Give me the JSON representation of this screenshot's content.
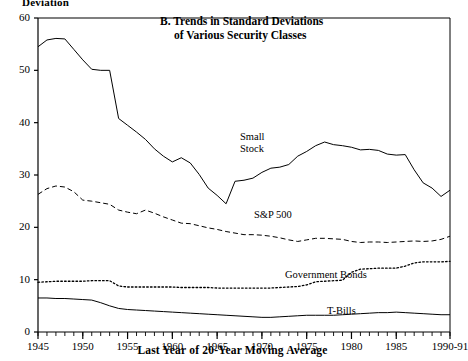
{
  "figure": {
    "title_line_1": "B. Trends in Standard Deviations",
    "title_line_2": "of Various Security Classes",
    "y_axis_caption": "Deviation",
    "x_axis_caption": "Last Year of 20-Year Moving Average"
  },
  "labels": {
    "small_stock": "Small\nStock",
    "small_stock_l1": "Small",
    "small_stock_l2": "Stock",
    "sp500": "S&P 500",
    "government_bonds": "Government Bonds",
    "tbills": "T-Bills"
  },
  "chart_data": {
    "type": "line",
    "title": "B. Trends in Standard Deviations of Various Security Classes",
    "xlabel": "Last Year of 20-Year Moving Average",
    "ylabel": "Deviation",
    "xlim": [
      1945,
      1991
    ],
    "ylim": [
      0,
      60
    ],
    "grid": false,
    "legend": "inline-annotations",
    "y_ticks": [
      0,
      10,
      20,
      30,
      40,
      50,
      60
    ],
    "x_ticks": [
      1945,
      1950,
      1955,
      1960,
      1965,
      1970,
      1975,
      1980,
      1985,
      1991
    ],
    "x_tick_labels": [
      "1945",
      "1950",
      "1955",
      "1960",
      "1965",
      "1970",
      "1975",
      "1980",
      "1985",
      "1990-91"
    ],
    "x_minor_tick_step": 1,
    "x": [
      1945,
      1946,
      1947,
      1948,
      1949,
      1950,
      1951,
      1952,
      1953,
      1954,
      1955,
      1956,
      1957,
      1958,
      1959,
      1960,
      1961,
      1962,
      1963,
      1964,
      1965,
      1966,
      1967,
      1968,
      1969,
      1970,
      1971,
      1972,
      1973,
      1974,
      1975,
      1976,
      1977,
      1978,
      1979,
      1980,
      1981,
      1982,
      1983,
      1984,
      1985,
      1986,
      1987,
      1988,
      1989,
      1990,
      1991
    ],
    "series": [
      {
        "name": "Small Stock",
        "style": "solid",
        "color": "#000000",
        "values": [
          54.5,
          55.8,
          56.1,
          56.0,
          54.0,
          52.0,
          50.2,
          50.0,
          50.0,
          40.8,
          39.5,
          38.2,
          36.8,
          35.0,
          33.6,
          32.5,
          33.3,
          32.3,
          30.1,
          27.5,
          26.1,
          24.5,
          28.8,
          29.0,
          29.4,
          30.5,
          31.3,
          31.5,
          32.0,
          33.6,
          34.5,
          35.6,
          36.3,
          35.8,
          35.6,
          35.3,
          34.8,
          34.9,
          34.7,
          34.0,
          33.8,
          33.9,
          31.0,
          28.5,
          27.5,
          25.9,
          27.1
        ]
      },
      {
        "name": "S&P 500",
        "style": "dashed",
        "color": "#000000",
        "values": [
          26.3,
          27.4,
          27.9,
          27.7,
          26.8,
          25.2,
          25.0,
          24.7,
          24.4,
          23.3,
          22.9,
          22.6,
          23.3,
          22.7,
          22.0,
          21.4,
          20.8,
          20.7,
          20.3,
          19.9,
          19.6,
          19.2,
          18.9,
          18.6,
          18.6,
          18.5,
          18.3,
          18.0,
          17.6,
          17.3,
          17.6,
          17.9,
          17.9,
          17.8,
          17.7,
          17.3,
          17.1,
          17.2,
          17.2,
          17.1,
          17.2,
          17.3,
          17.4,
          17.3,
          17.4,
          17.7,
          18.3
        ]
      },
      {
        "name": "Government Bonds",
        "style": "dotted",
        "color": "#000000",
        "values": [
          9.5,
          9.6,
          9.7,
          9.7,
          9.7,
          9.7,
          9.8,
          9.8,
          9.8,
          8.8,
          8.6,
          8.6,
          8.6,
          8.6,
          8.6,
          8.6,
          8.5,
          8.5,
          8.5,
          8.5,
          8.4,
          8.4,
          8.4,
          8.4,
          8.4,
          8.4,
          8.4,
          8.5,
          8.6,
          8.7,
          9.0,
          9.6,
          9.7,
          9.8,
          9.9,
          11.4,
          12.0,
          12.1,
          12.2,
          12.2,
          12.2,
          12.6,
          13.2,
          13.4,
          13.4,
          13.4,
          13.5
        ]
      },
      {
        "name": "T-Bills",
        "style": "solid",
        "color": "#000000",
        "values": [
          6.5,
          6.5,
          6.4,
          6.4,
          6.3,
          6.2,
          6.1,
          5.6,
          5.0,
          4.5,
          4.3,
          4.2,
          4.1,
          4.0,
          3.9,
          3.8,
          3.7,
          3.6,
          3.5,
          3.4,
          3.3,
          3.2,
          3.1,
          3.0,
          2.9,
          2.8,
          2.8,
          2.9,
          3.0,
          3.1,
          3.2,
          3.2,
          3.2,
          3.2,
          3.3,
          3.4,
          3.5,
          3.6,
          3.7,
          3.7,
          3.8,
          3.7,
          3.6,
          3.5,
          3.4,
          3.3,
          3.3
        ]
      }
    ]
  }
}
